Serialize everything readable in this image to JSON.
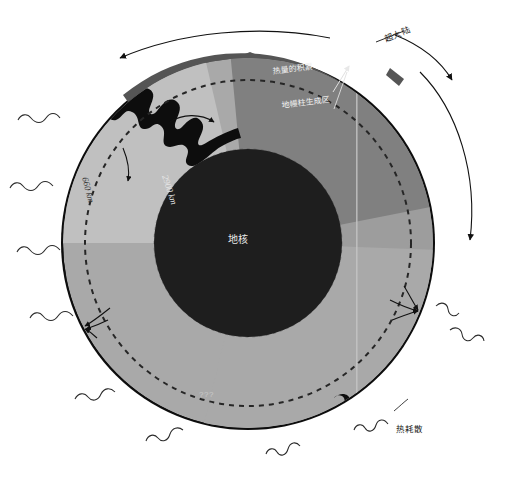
{
  "diagram": {
    "type": "earth-cross-section",
    "labels": {
      "supercontinent": "超大陆",
      "heat_accumulation": "热量的积累",
      "plume_generation_zone": "地幔柱生成区",
      "core": "地核",
      "heat_dissipation": "热耗散",
      "depth_660": "660 km",
      "depth_2900": "2900 km",
      "unknown": "???"
    },
    "colors": {
      "background": "#ffffff",
      "outer_shell": "#111111",
      "supercontinent_slab": "#4d4d4d",
      "upper_mantle": "#a8a8a8",
      "mantle_light_wedge": "#bdbdbd",
      "mantle_dark_wedge": "#7e7e7e",
      "lower_mantle": "#9a9a9a",
      "core": "#1c1c1c",
      "slab_dark": "#111111",
      "dashed_boundary": "#2b2b2b",
      "label_white": "#f0f0f0",
      "label_dark": "#1b1b1b",
      "question_marks": "#c9c9c9"
    },
    "features": [
      {
        "name": "outer-shell",
        "description": "黑色外壳（岩石圈）"
      },
      {
        "name": "supercontinent-slab",
        "description": "顶部深灰超大陆板块"
      },
      {
        "name": "mantle",
        "description": "灰色地幔"
      },
      {
        "name": "core",
        "description": "黑色地核"
      },
      {
        "name": "subducting-slab",
        "description": "左上俯冲板片"
      },
      {
        "name": "dashed-660-boundary",
        "description": "660 km 虚线界面"
      },
      {
        "name": "dashed-2900-boundary",
        "description": "2900 km 核幔边界"
      },
      {
        "name": "rotation-arrows",
        "description": "外侧弧形旋转箭头"
      },
      {
        "name": "squiggly-heat-arrows",
        "description": "波浪形热耗散箭头"
      },
      {
        "name": "convection-arrows",
        "description": "地幔对流箭头"
      }
    ]
  }
}
